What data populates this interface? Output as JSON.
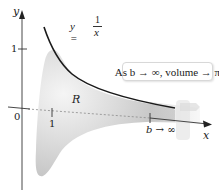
{
  "figure": {
    "type": "Gabriel's horn (solid of revolution) diagram",
    "axes": {
      "y_label": "y",
      "x_label": "x",
      "origin_label": "0",
      "y_tick_label": "1",
      "x_tick_label": "1"
    },
    "curve": {
      "lhs": "y =",
      "numerator": "1",
      "denominator": "x"
    },
    "region_label": "R",
    "limit_label": "b → ∞",
    "callout_text": "As b → ∞, volume → π",
    "colors": {
      "curve": "#1a1a1a",
      "axes": "#333333",
      "solid_shade": "#bdbdbd",
      "background": "#ffffff",
      "callout_border": "#d8d8d8"
    }
  }
}
